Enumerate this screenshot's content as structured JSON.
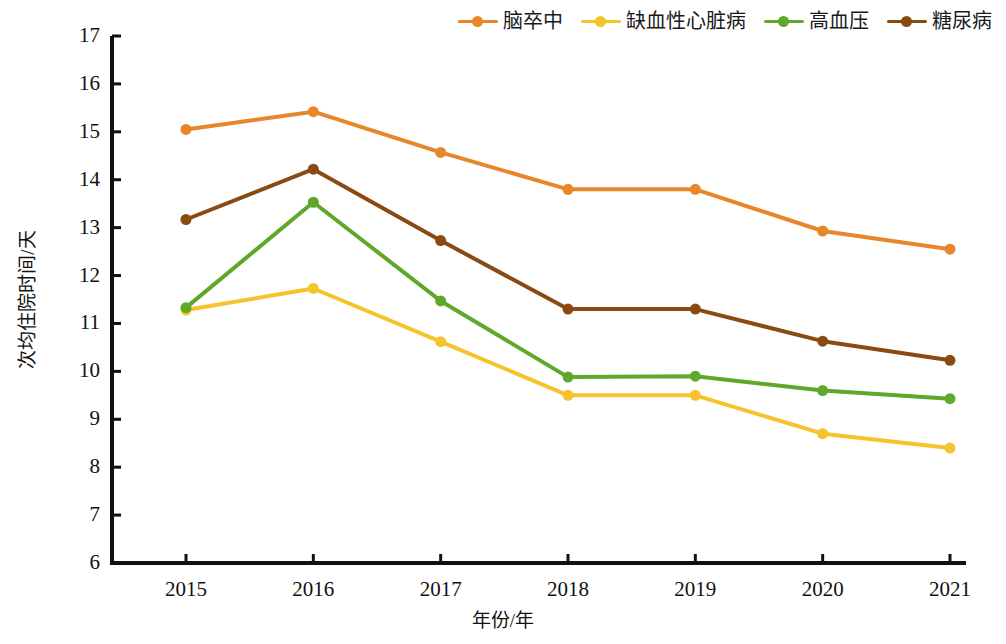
{
  "chart_data": {
    "type": "line",
    "title": "",
    "xlabel": "年份/年",
    "ylabel": "次均住院时间/天",
    "categories": [
      "2015",
      "2016",
      "2017",
      "2018",
      "2019",
      "2020",
      "2021"
    ],
    "ylim": [
      6,
      17
    ],
    "ytick_step": 1,
    "yticks": [
      "17",
      "16",
      "15",
      "14",
      "13",
      "12",
      "11",
      "10",
      "9",
      "8",
      "7",
      "6"
    ],
    "grid": false,
    "legend_position": "top-right",
    "series": [
      {
        "name": "脑卒中",
        "color": "#E8862A",
        "values": [
          15.05,
          15.42,
          14.57,
          13.8,
          13.8,
          12.93,
          12.55
        ]
      },
      {
        "name": "缺血性心脏病",
        "color": "#F5C42C",
        "values": [
          11.28,
          11.73,
          10.62,
          9.5,
          9.5,
          8.7,
          8.4
        ]
      },
      {
        "name": "高血压",
        "color": "#5FA82A",
        "values": [
          11.33,
          13.53,
          11.47,
          9.88,
          9.9,
          9.6,
          9.43
        ]
      },
      {
        "name": "糖尿病",
        "color": "#8A4A13",
        "values": [
          13.17,
          14.22,
          12.73,
          11.3,
          11.3,
          10.63,
          10.23
        ]
      }
    ]
  },
  "axis": {
    "color": "#111111"
  }
}
